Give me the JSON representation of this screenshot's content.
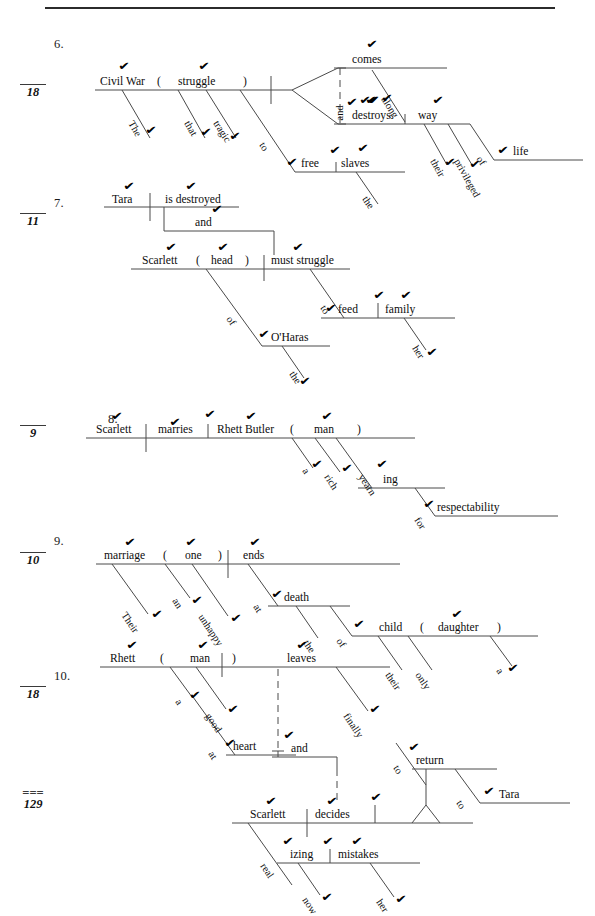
{
  "page": {
    "total_score": {
      "equals": "===",
      "denominator": "129"
    }
  },
  "items": [
    {
      "number": "6.",
      "score_denominator": "18",
      "words": [
        "Civil War",
        "(",
        "struggle",
        ")",
        "The",
        "that",
        "tragic",
        "to",
        "free",
        "slaves",
        "the",
        "comes",
        "and",
        "along",
        "destroys",
        "way",
        "their",
        "privileged",
        "of",
        "life"
      ]
    },
    {
      "number": "7.",
      "score_denominator": "11",
      "words": [
        "Tara",
        "is destroyed",
        "and",
        "Scarlett",
        "(",
        "head",
        ")",
        "of",
        "O'Haras",
        "the",
        "must struggle",
        "to",
        "feed",
        "family",
        "her"
      ]
    },
    {
      "number": "8.",
      "score_denominator": "9",
      "words": [
        "Scarlett",
        "marries",
        "Rhett Butler",
        "(",
        "man",
        ")",
        "a",
        "rich",
        "yearn",
        "ing",
        "for",
        "respectability"
      ]
    },
    {
      "number": "9.",
      "score_denominator": "10",
      "words": [
        "marriage",
        "(",
        "one",
        ")",
        "ends",
        "Their",
        "an",
        "unhappy",
        "at",
        "death",
        "the",
        "of",
        "child",
        "(",
        "daughter",
        ")",
        "their",
        "only",
        "a"
      ]
    },
    {
      "number": "10.",
      "score_denominator": "18",
      "words": [
        "Rhett",
        "(",
        "man",
        ")",
        "leaves",
        "a",
        "good",
        "at",
        "heart",
        "finally",
        "and",
        "Scarlett",
        "decides",
        "real",
        "izing",
        "now",
        "mistakes",
        "her",
        "to",
        "return",
        "to",
        "Tara"
      ]
    }
  ],
  "glyphs": {
    "check": "✔"
  }
}
